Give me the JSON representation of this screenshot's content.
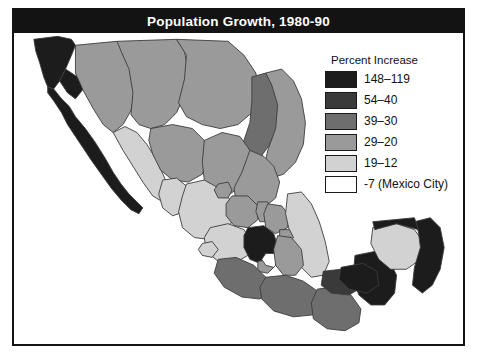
{
  "figure": {
    "title": "Population Growth, 1980-90",
    "title_bar_color": "#131313",
    "frame_color": "#141414",
    "background": "#ffffff"
  },
  "legend": {
    "title": "Percent Increase",
    "items": [
      {
        "label": "148–119",
        "color": "#1c1c1c",
        "class_name": "highest"
      },
      {
        "label": "54–40",
        "color": "#3a3a3a",
        "class_name": "high"
      },
      {
        "label": "39–30",
        "color": "#6e6e6e",
        "class_name": "upper-mid"
      },
      {
        "label": "29–20",
        "color": "#9a9a9a",
        "class_name": "mid"
      },
      {
        "label": "19–12",
        "color": "#d2d2d2",
        "class_name": "low"
      },
      {
        "label": "-7 (Mexico City)",
        "color": "#ffffff",
        "class_name": "negative"
      }
    ]
  },
  "map": {
    "region": "Mexico",
    "border_color": "#3b3b3b",
    "regions": [
      {
        "name": "baja-california-norte",
        "class_name": "highest",
        "d": "M20 6 L44 3 L58 6 L62 12 L58 22 L52 36 L46 48 L40 56 L34 54 L30 44 L26 30 L22 18 Z"
      },
      {
        "name": "baja-california-sur",
        "class_name": "highest",
        "d": "M34 54 L40 56 L48 66 L56 74 L62 84 L72 96 L82 110 L92 126 L100 140 L108 152 L116 162 L124 170 L130 176 L126 182 L118 178 L108 168 L98 156 L88 142 L78 128 L70 116 L62 104 L54 92 L48 80 L40 68 L34 60 Z"
      },
      {
        "name": "baja-north-gap",
        "class_name": "highest",
        "d": "M46 48 L52 36 L64 44 L70 56 L62 66 L54 60 Z"
      },
      {
        "name": "sonora",
        "class_name": "mid",
        "d": "M62 12 L104 8 L112 18 L118 36 L122 58 L118 78 L110 92 L100 100 L90 92 L80 76 L70 58 L62 40 Z"
      },
      {
        "name": "chihuahua",
        "class_name": "mid",
        "d": "M104 8 L164 6 L172 18 L176 40 L172 62 L164 80 L152 92 L138 96 L126 92 L118 82 L120 60 L116 36 L108 18 Z"
      },
      {
        "name": "coahuila",
        "class_name": "mid",
        "d": "M164 6 L216 8 L232 22 L244 40 L248 62 L240 80 L226 92 L208 96 L190 92 L174 84 L166 70 L172 46 L174 22 Z"
      },
      {
        "name": "nuevo-leon",
        "class_name": "upper-mid",
        "d": "M240 44 L254 40 L264 52 L268 72 L266 94 L258 112 L248 126 L238 132 L230 124 L232 108 L238 90 L240 68 Z"
      },
      {
        "name": "tamaulipas",
        "class_name": "mid",
        "d": "M254 40 L270 36 L282 48 L290 66 L294 90 L292 112 L284 130 L272 142 L260 146 L252 138 L256 118 L264 96 L266 72 L260 52 Z"
      },
      {
        "name": "sinaloa",
        "class_name": "low",
        "d": "M100 100 L112 94 L124 100 L134 112 L144 128 L152 146 L158 162 L150 170 L140 164 L130 150 L120 134 L110 118 Z"
      },
      {
        "name": "durango",
        "class_name": "mid",
        "d": "M138 96 L160 92 L180 96 L192 108 L196 126 L190 142 L176 150 L160 148 L148 138 L140 122 L136 108 Z"
      },
      {
        "name": "zacatecas",
        "class_name": "mid",
        "d": "M192 108 L210 100 L228 104 L238 118 L240 136 L232 152 L218 162 L202 160 L192 148 L190 130 Z"
      },
      {
        "name": "san-luis-potosi",
        "class_name": "mid",
        "d": "M238 118 L252 124 L262 134 L268 150 L264 166 L252 176 L236 178 L224 170 L222 156 L230 140 Z"
      },
      {
        "name": "nayarit",
        "class_name": "low",
        "d": "M150 148 L164 146 L174 154 L178 168 L172 180 L160 184 L150 176 L146 162 Z"
      },
      {
        "name": "jalisco",
        "class_name": "low",
        "d": "M174 152 L192 148 L210 158 L220 170 L222 186 L214 200 L198 208 L182 206 L170 196 L166 180 L170 164 Z"
      },
      {
        "name": "aguascalientes",
        "class_name": "mid",
        "d": "M206 152 L216 150 L220 158 L216 166 L206 166 L202 158 Z"
      },
      {
        "name": "guanajuato",
        "class_name": "mid",
        "d": "M220 164 L236 164 L246 174 L246 188 L236 196 L222 194 L214 184 L214 172 Z"
      },
      {
        "name": "queretaro",
        "class_name": "mid",
        "d": "M246 170 L256 170 L262 180 L258 190 L248 190 L244 180 Z"
      },
      {
        "name": "hidalgo",
        "class_name": "mid",
        "d": "M256 172 L270 174 L278 184 L276 196 L264 202 L254 196 L252 182 Z"
      },
      {
        "name": "veracruz",
        "class_name": "low",
        "d": "M276 162 L290 160 L300 172 L308 190 L314 210 L318 230 L312 244 L300 246 L290 236 L284 218 L278 200 L274 182 Z"
      },
      {
        "name": "michoacan",
        "class_name": "low",
        "d": "M198 196 L216 192 L232 198 L240 210 L236 224 L222 232 L206 230 L194 220 L192 206 Z"
      },
      {
        "name": "mexico-state",
        "class_name": "highest",
        "d": "M236 196 L252 194 L262 202 L266 214 L260 226 L248 232 L238 228 L232 216 L232 204 Z"
      },
      {
        "name": "morelos",
        "class_name": "mid",
        "d": "M246 230 L258 228 L262 236 L256 242 L246 240 Z"
      },
      {
        "name": "mexico-city",
        "class_name": "negative",
        "d": "M254 222 L264 222 L268 230 L262 236 L254 234 L250 228 Z"
      },
      {
        "name": "tlaxcala",
        "class_name": "mid",
        "d": "M268 198 L278 198 L282 206 L276 210 L268 206 Z"
      },
      {
        "name": "puebla",
        "class_name": "mid",
        "d": "M266 204 L280 206 L290 218 L292 234 L284 244 L272 244 L264 234 L262 218 Z"
      },
      {
        "name": "colima",
        "class_name": "low",
        "d": "M190 212 L200 210 L206 218 L200 226 L190 224 L186 218 Z"
      },
      {
        "name": "guerrero",
        "class_name": "upper-mid",
        "d": "M206 228 L224 226 L242 234 L254 246 L260 260 L248 268 L230 266 L212 256 L202 242 Z"
      },
      {
        "name": "oaxaca",
        "class_name": "upper-mid",
        "d": "M254 246 L274 244 L292 250 L306 260 L312 274 L302 284 L282 286 L262 280 L250 268 L248 256 Z"
      },
      {
        "name": "chiapas",
        "class_name": "upper-mid",
        "d": "M306 258 L324 256 L340 264 L350 278 L348 292 L334 300 L316 298 L302 288 L300 272 Z"
      },
      {
        "name": "tabasco",
        "class_name": "high",
        "d": "M312 240 L330 238 L344 246 L348 258 L338 264 L320 262 L310 254 Z"
      },
      {
        "name": "campeche",
        "class_name": "highest",
        "d": "M344 224 L364 220 L378 228 L386 244 L384 262 L374 274 L360 274 L348 264 L342 248 Z"
      },
      {
        "name": "yucatan",
        "class_name": "low",
        "d": "M362 196 L386 192 L404 198 L414 212 L410 228 L396 238 L380 238 L368 228 L360 212 Z"
      },
      {
        "name": "quintana-roo",
        "class_name": "highest",
        "d": "M404 190 L420 186 L430 196 L434 216 L430 238 L422 254 L412 262 L402 254 L404 236 L410 216 L408 200 Z"
      },
      {
        "name": "yucatan-coast-strip",
        "class_name": "highest",
        "d": "M362 190 L404 186 L408 198 L386 192 L364 198 Z"
      },
      {
        "name": "isthmus-dark",
        "class_name": "highest",
        "d": "M330 236 L352 232 L366 240 L368 254 L356 262 L338 258 L328 248 Z"
      }
    ]
  }
}
